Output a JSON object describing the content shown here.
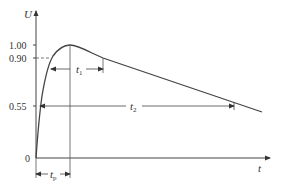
{
  "diagram": {
    "type": "waveform",
    "axes": {
      "y_label": "U",
      "x_label": "t",
      "origin_label": "0"
    },
    "y_ticks": [
      {
        "label": "1.00",
        "value": 1.0
      },
      {
        "label": "0.90",
        "value": 0.9
      },
      {
        "label": "0.55",
        "value": 0.55
      }
    ],
    "dimensions": {
      "t1": {
        "symbol": "t",
        "sub": "1"
      },
      "t2": {
        "symbol": "t",
        "sub": "2"
      },
      "tp": {
        "symbol": "t",
        "sub": "p"
      }
    },
    "colors": {
      "line": "#444444",
      "text": "#333333"
    }
  }
}
